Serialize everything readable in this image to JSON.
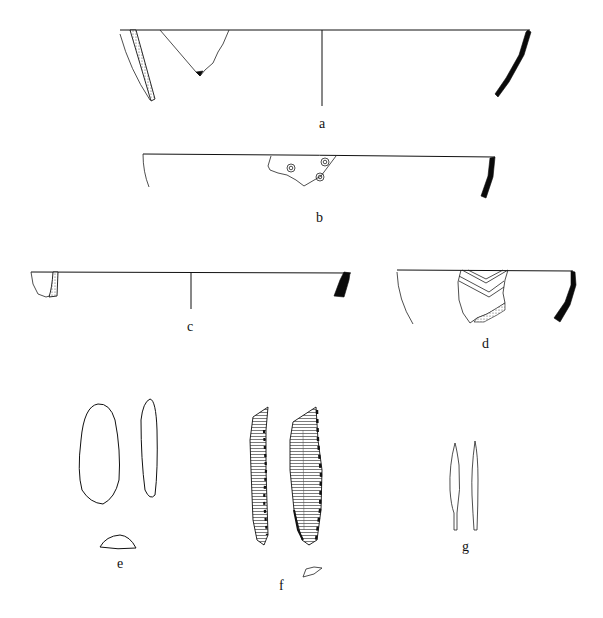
{
  "figure": {
    "type": "archaeological-finds-plate",
    "background": "#ffffff",
    "ink_color": "#111111"
  },
  "items": [
    {
      "id": "a",
      "label": "a",
      "description": "large bowl rim profile with section and sherd fragment, centerline"
    },
    {
      "id": "b",
      "label": "b",
      "description": "bowl rim profile with sherd bearing three circular stamps"
    },
    {
      "id": "c",
      "label": "c",
      "description": "shallow dish rim profile with section, centerline"
    },
    {
      "id": "d",
      "label": "d",
      "description": "bowl rim profile with chevron-incised sherd"
    },
    {
      "id": "e",
      "label": "e",
      "description": "ground stone tool, face, side and cross-section"
    },
    {
      "id": "f",
      "label": "f",
      "description": "flint blade, two faces with retouch and cross-section"
    },
    {
      "id": "g",
      "label": "g",
      "description": "tanged metal point, face and side views"
    }
  ]
}
